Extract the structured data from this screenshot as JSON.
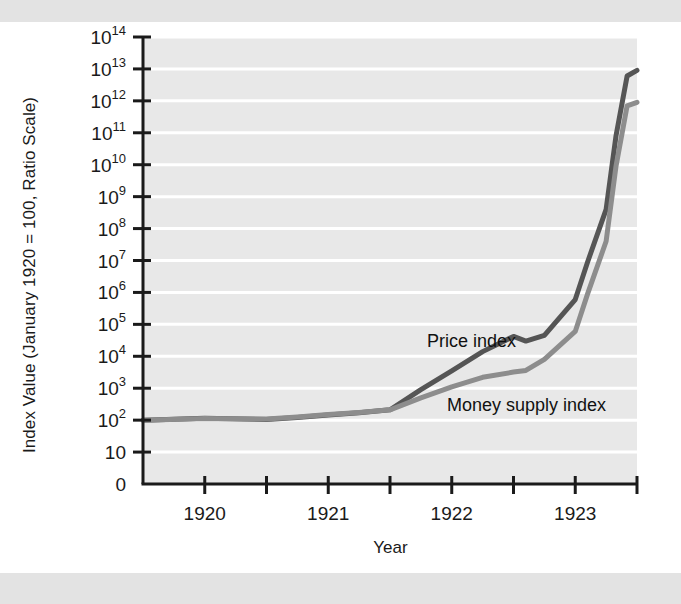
{
  "chart_data": {
    "type": "line",
    "title": "",
    "xlabel": "Year",
    "ylabel": "Index Value (January 1920 = 100, Ratio Scale)",
    "scale": "log",
    "grid": true,
    "legend_position": "inline-annotation",
    "xlim": [
      1919.5,
      1923.5
    ],
    "x_ticks": [
      1919.5,
      1920.0,
      1920.5,
      1921.0,
      1921.5,
      1922.0,
      1922.5,
      1923.0,
      1923.5
    ],
    "x_tick_labels": [
      "",
      "1920",
      "",
      "1921",
      "",
      "1922",
      "",
      "1923",
      ""
    ],
    "y_ticks": [
      0,
      10,
      100,
      1000,
      10000,
      100000,
      1000000,
      10000000,
      100000000,
      1000000000,
      10000000000,
      100000000000,
      1000000000000,
      10000000000000,
      100000000000000
    ],
    "y_tick_labels": [
      {
        "base": "0",
        "exp": ""
      },
      {
        "base": "10",
        "exp": ""
      },
      {
        "base": "10",
        "exp": "2"
      },
      {
        "base": "10",
        "exp": "3"
      },
      {
        "base": "10",
        "exp": "4"
      },
      {
        "base": "10",
        "exp": "5"
      },
      {
        "base": "10",
        "exp": "6"
      },
      {
        "base": "10",
        "exp": "7"
      },
      {
        "base": "10",
        "exp": "8"
      },
      {
        "base": "10",
        "exp": "9"
      },
      {
        "base": "10",
        "exp": "10"
      },
      {
        "base": "10",
        "exp": "11"
      },
      {
        "base": "10",
        "exp": "12"
      },
      {
        "base": "10",
        "exp": "13"
      },
      {
        "base": "10",
        "exp": "14"
      }
    ],
    "series": [
      {
        "name": "Price index",
        "color": "#555555",
        "annotation": "Price index",
        "x": [
          1919.5,
          1920.0,
          1920.5,
          1920.75,
          1921.0,
          1921.25,
          1921.5,
          1921.75,
          1922.0,
          1922.25,
          1922.5,
          1922.6,
          1922.75,
          1923.0,
          1923.1,
          1923.25,
          1923.33,
          1923.42,
          1923.5
        ],
        "y": [
          100,
          115,
          105,
          120,
          145,
          170,
          210,
          900,
          3500,
          14000,
          42000,
          30000,
          45000,
          600000,
          9000000,
          400000000,
          80000000000,
          6000000000000,
          9000000000000
        ]
      },
      {
        "name": "Money supply index",
        "color": "#8d8d8d",
        "annotation": "Money supply index",
        "x": [
          1919.5,
          1920.0,
          1920.5,
          1920.75,
          1921.0,
          1921.25,
          1921.5,
          1921.75,
          1922.0,
          1922.25,
          1922.5,
          1922.6,
          1922.75,
          1923.0,
          1923.1,
          1923.25,
          1923.33,
          1923.42,
          1923.5
        ],
        "y": [
          100,
          112,
          108,
          125,
          150,
          175,
          210,
          500,
          1100,
          2200,
          3200,
          3600,
          8000,
          60000,
          900000,
          40000000,
          9000000000,
          700000000000,
          900000000000
        ]
      }
    ],
    "annotations": [
      {
        "text": "Price index",
        "x_px": 427,
        "y_px": 347,
        "align": "left"
      },
      {
        "text": "Money supply index",
        "x_px": 447,
        "y_px": 411,
        "align": "left"
      }
    ]
  },
  "style": {
    "plot_background": "#e8e8e8",
    "gridline_color": "#ffffff",
    "axis_color": "#1a1a1a",
    "page_background": "#ffffff",
    "band_color": "#e3e3e3"
  }
}
